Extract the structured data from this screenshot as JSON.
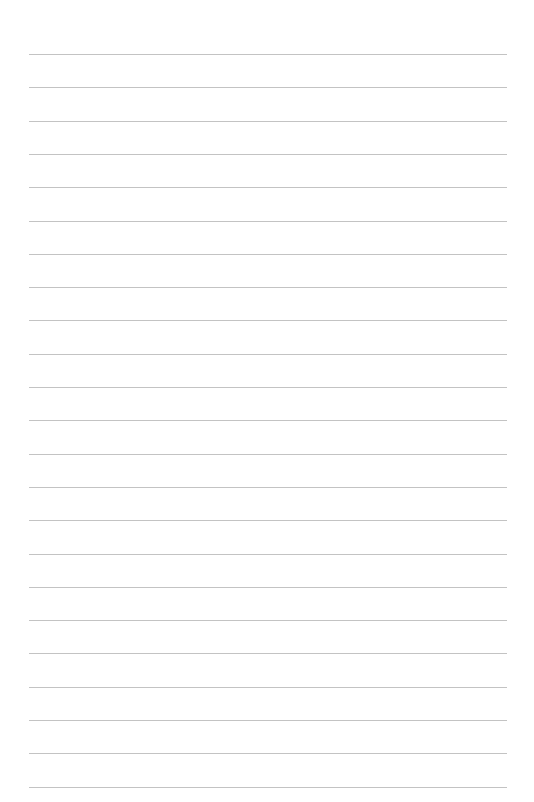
{
  "document": {
    "type": "lined-paper",
    "background_color": "#ffffff",
    "rule_color": "#b8b8b8",
    "rule_count": 23,
    "first_rule_y": 54,
    "rule_spacing": 33.3,
    "rule_left": 29,
    "rule_right": 507,
    "text_content": []
  }
}
